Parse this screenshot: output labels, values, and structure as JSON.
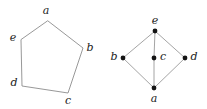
{
  "figure": {
    "background_color": "#ffffff",
    "edge_color": "#8c8c8c",
    "node_color": "#141414",
    "label_color": "#1b1b1b",
    "panels": [
      {
        "name": "pentagon",
        "kind": "polygon",
        "vertices": [
          {
            "id": "a",
            "label": "a",
            "x": 48,
            "y": 21,
            "label_x": 46,
            "label_y": 11
          },
          {
            "id": "b",
            "label": "b",
            "x": 83,
            "y": 48,
            "label_x": 90,
            "label_y": 48
          },
          {
            "id": "c",
            "label": "c",
            "x": 68,
            "y": 93,
            "label_x": 68,
            "label_y": 101
          },
          {
            "id": "d",
            "label": "d",
            "x": 22,
            "y": 86,
            "label_x": 14,
            "label_y": 83
          },
          {
            "id": "e",
            "label": "e",
            "x": 21,
            "y": 40,
            "label_x": 13,
            "label_y": 38
          }
        ],
        "edges": [
          [
            "a",
            "b"
          ],
          [
            "b",
            "c"
          ],
          [
            "c",
            "d"
          ],
          [
            "d",
            "e"
          ],
          [
            "e",
            "a"
          ]
        ],
        "show_dots": false,
        "path": "48,21 83,48 68,93 22,86 21,40"
      },
      {
        "name": "lattice",
        "kind": "graph",
        "vertices": [
          {
            "id": "e",
            "label": "e",
            "x": 155,
            "y": 31,
            "label_x": 155,
            "label_y": 21
          },
          {
            "id": "b",
            "label": "b",
            "x": 123,
            "y": 58,
            "label_x": 114,
            "label_y": 57
          },
          {
            "id": "c",
            "label": "c",
            "x": 154,
            "y": 58,
            "label_x": 163,
            "label_y": 57
          },
          {
            "id": "d",
            "label": "d",
            "x": 185,
            "y": 58,
            "label_x": 194,
            "label_y": 57
          },
          {
            "id": "a",
            "label": "a",
            "x": 154,
            "y": 88,
            "label_x": 154,
            "label_y": 99
          }
        ],
        "edges": [
          [
            "e",
            "b"
          ],
          [
            "e",
            "c"
          ],
          [
            "e",
            "d"
          ],
          [
            "b",
            "a"
          ],
          [
            "c",
            "a"
          ],
          [
            "d",
            "a"
          ]
        ],
        "show_dots": true,
        "dot_radius": 2.4,
        "path": "155,31 123,58 154,88 185,58"
      }
    ]
  }
}
